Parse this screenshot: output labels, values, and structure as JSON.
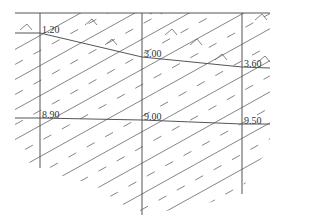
{
  "diagram": {
    "type": "geological-cross-section",
    "colors": {
      "line": "#555555",
      "hatch": "#666666",
      "text": "#333333",
      "background": "#ffffff"
    },
    "boreholes": [
      {
        "id": "left",
        "x": 40,
        "top_y": 13,
        "bottom_y": 168,
        "upper_depth": "1.20",
        "lower_depth": "8.90"
      },
      {
        "id": "middle",
        "x": 142,
        "top_y": 13,
        "bottom_y": 215,
        "upper_depth": "3.00",
        "lower_depth": "9.00"
      },
      {
        "id": "right",
        "x": 242,
        "top_y": 13,
        "bottom_y": 194,
        "upper_depth": "3.60",
        "lower_depth": "9.50"
      }
    ],
    "labels": {
      "l1": "1.20",
      "l2": "3.00",
      "l3": "3.60",
      "l4": "8.90",
      "l5": "9.00",
      "l6": "9.50"
    },
    "layers": [
      {
        "name": "upper-layer",
        "pattern": "diagonal lines with dashes and small hook marks"
      },
      {
        "name": "middle-layer",
        "pattern": "diagonal lines with dashes"
      },
      {
        "name": "lower-layer",
        "pattern": "diagonal lines with dashes"
      }
    ]
  }
}
